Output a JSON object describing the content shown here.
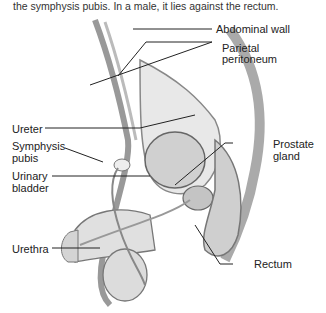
{
  "caption": "the symphysis pubis. In a male, it lies against the rectum.",
  "labels": {
    "abdominal_wall": "Abdominal wall",
    "parietal_peritoneum_1": "Parietal",
    "parietal_peritoneum_2": "peritoneum",
    "ureter": "Ureter",
    "symphysis_pubis_1": "Symphysis",
    "symphysis_pubis_2": "pubis",
    "urinary_bladder_1": "Urinary",
    "urinary_bladder_2": "bladder",
    "prostate_gland_1": "Prostate",
    "prostate_gland_2": "gland",
    "urethra": "Urethra",
    "rectum": "Rectum"
  }
}
